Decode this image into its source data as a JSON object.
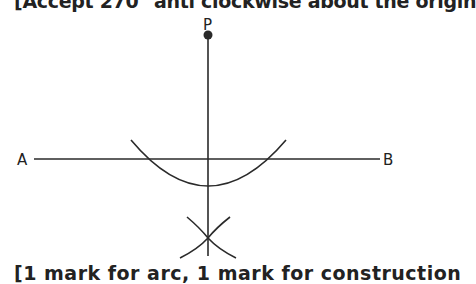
{
  "header_note": "[Accept 270° anti clockwise about the origin",
  "footer_note": "[1 mark for arc, 1 mark for construction",
  "diagram": {
    "type": "perpendicular-from-point-construction",
    "labels": {
      "point": "P",
      "left": "A",
      "right": "B"
    },
    "colors": {
      "stroke": "#2a2a2a",
      "text": "#222222"
    }
  }
}
